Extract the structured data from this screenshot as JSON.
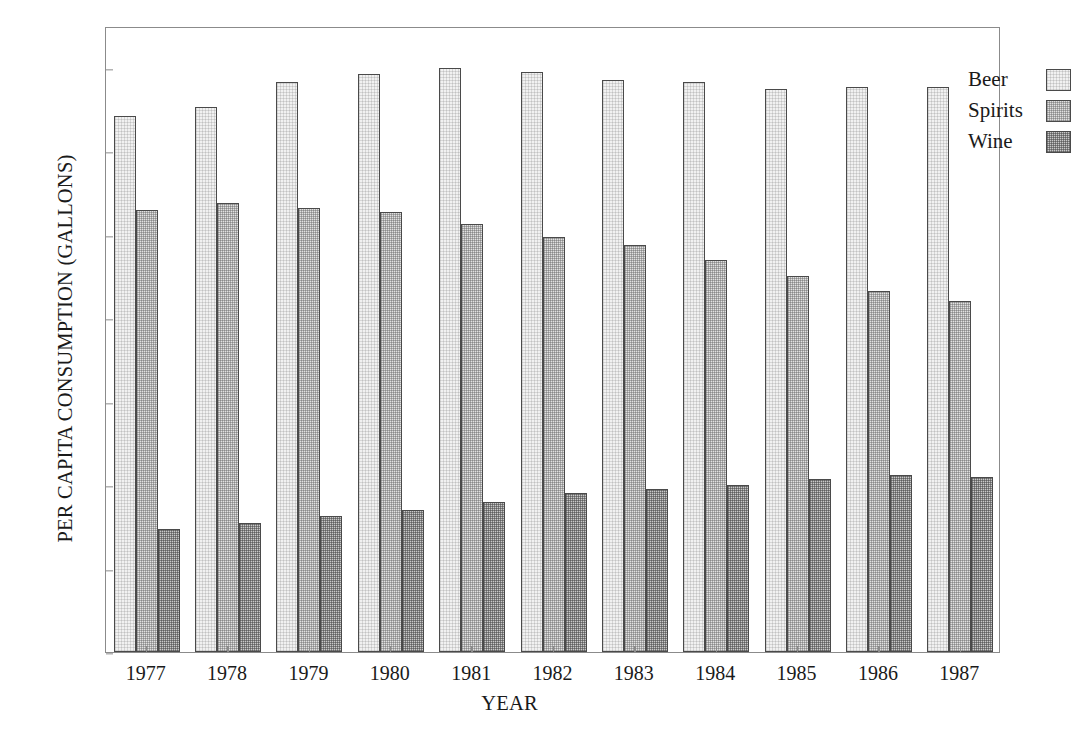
{
  "chart_data": {
    "type": "bar",
    "title": "",
    "xlabel": "YEAR",
    "ylabel": "PER CAPITA CONSUMPTION (GALLONS)",
    "categories": [
      "1977",
      "1978",
      "1979",
      "1980",
      "1981",
      "1982",
      "1983",
      "1984",
      "1985",
      "1986",
      "1987"
    ],
    "series": [
      {
        "name": "Beer",
        "color": "#f1f1f1",
        "values": [
          1.285,
          1.305,
          1.365,
          1.385,
          1.4,
          1.39,
          1.37,
          1.365,
          1.35,
          1.355,
          1.355
        ]
      },
      {
        "name": "Spirits",
        "color": "#e1e1e1",
        "values": [
          1.06,
          1.075,
          1.065,
          1.055,
          1.025,
          0.995,
          0.975,
          0.94,
          0.9,
          0.865,
          0.84
        ]
      },
      {
        "name": "Wine",
        "color": "#c9c9c9",
        "values": [
          0.295,
          0.31,
          0.325,
          0.34,
          0.36,
          0.38,
          0.39,
          0.4,
          0.415,
          0.425,
          0.42
        ]
      }
    ],
    "ylim": [
      0.0,
      1.5
    ],
    "yticks": [
      "0.0",
      "0.2",
      "0.4",
      "0.6",
      "0.8",
      "1.0",
      "1.2",
      "1.4"
    ],
    "ytick_values": [
      0.0,
      0.2,
      0.4,
      0.6,
      0.8,
      1.0,
      1.2,
      1.4
    ],
    "grid": false,
    "legend_position": "top-right",
    "legend": [
      "Beer",
      "Spirits",
      "Wine"
    ]
  }
}
